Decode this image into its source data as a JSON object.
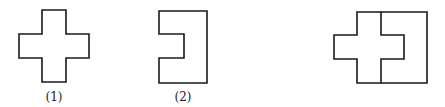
{
  "figure": {
    "stroke_color": "#1a1a1a",
    "background": "#ffffff"
  },
  "shapes": [
    {
      "id": "shape-1",
      "label": "(1)",
      "kind": "cross",
      "points": "42,10 66,10 66,34 89,34 89,58 66,58 66,82 42,82 42,58 19,58 19,34 42,34"
    },
    {
      "id": "shape-2",
      "label": "(2)",
      "kind": "notched-rectangle",
      "points": "159,11 207,11 207,83 159,83 159,58 184,58 184,34 159,34"
    },
    {
      "id": "combined",
      "label": "",
      "kind": "cross-inside-notched-rectangle",
      "cross_points": "357,12 381,12 381,35 404,35 404,59 381,59 381,83 357,83 357,59 334,59 334,35 357,35",
      "outer_points": "381,12 427,12 427,83 381,83"
    }
  ],
  "labels": {
    "one": "(1)",
    "two": "(2)"
  }
}
